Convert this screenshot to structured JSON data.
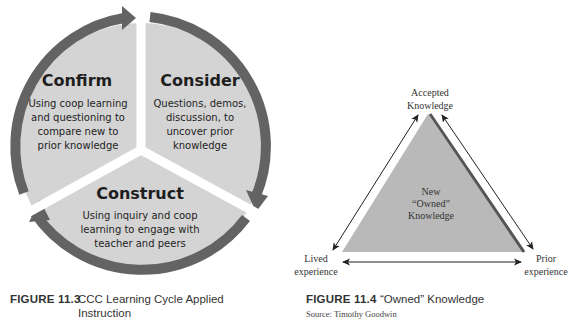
{
  "figures": [
    {
      "number": "FIGURE 11.3",
      "title_line1": "CCC Learning Cycle Applied",
      "title_line2": "Instruction",
      "diagram": {
        "type": "cycle",
        "segments": [
          {
            "heading": "Confirm",
            "lines": [
              "Using coop learning",
              "and questioning to",
              "compare new to",
              "prior knowledge"
            ]
          },
          {
            "heading": "Consider",
            "lines": [
              "Questions, demos,",
              "discussion, to",
              "uncover prior",
              "knowledge"
            ]
          },
          {
            "heading": "Construct",
            "lines": [
              "Using inquiry and coop",
              "learning to engage with",
              "teacher and peers"
            ]
          }
        ],
        "colors": {
          "fill": "#d4d4d4",
          "ring": "#636363",
          "text": "#1e1e1e"
        }
      }
    },
    {
      "number": "FIGURE 11.4",
      "title": "“Owned” Knowledge",
      "source": "Source: Timothy Goodwin",
      "diagram": {
        "type": "triangle",
        "center_lines": [
          "New",
          "“Owned”",
          "Knowledge"
        ],
        "vertices": {
          "top": [
            "Accepted",
            "Knowledge"
          ],
          "left": [
            "Lived",
            "experience"
          ],
          "right": [
            "Prior",
            "experience"
          ]
        },
        "colors": {
          "fill": "#b9b9b9",
          "edge": "#555555",
          "arrow": "#222222"
        }
      }
    }
  ]
}
